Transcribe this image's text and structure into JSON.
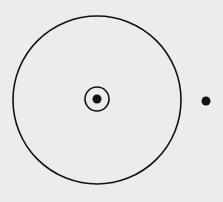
{
  "diagram": {
    "background": "#ececec",
    "stroke": "#111111",
    "outer_circle": {
      "cx": 97,
      "cy": 100,
      "r": 84
    },
    "center_ring": {
      "cx": 97,
      "cy": 99,
      "r": 12
    },
    "center_dot": {
      "cx": 97,
      "cy": 99,
      "r": 4.5
    },
    "external_dot": {
      "cx": 206,
      "cy": 101,
      "r": 4.5
    }
  }
}
